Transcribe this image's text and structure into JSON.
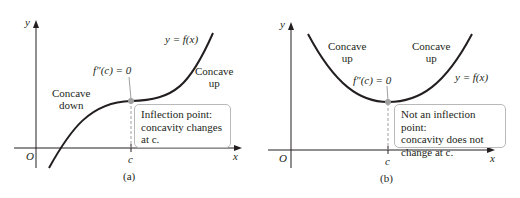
{
  "panels": [
    {
      "id": "a",
      "caption": "(a)",
      "axis": {
        "x_label": "x",
        "y_label": "y",
        "origin_label": "O",
        "tick_label": "c"
      },
      "curve_label": "y = f(x)",
      "point_label": "f″(c) = 0",
      "regions": [
        {
          "line1": "Concave",
          "line2": "down"
        },
        {
          "line1": "Concave",
          "line2": "up"
        }
      ],
      "note": {
        "line1": "Inflection point:",
        "line2": "concavity changes",
        "line3": "at c."
      }
    },
    {
      "id": "b",
      "caption": "(b)",
      "axis": {
        "x_label": "x",
        "y_label": "y",
        "origin_label": "O",
        "tick_label": "c"
      },
      "curve_label": "y = f(x)",
      "point_label": "f″(c) = 0",
      "regions": [
        {
          "line1": "Concave",
          "line2": "up"
        },
        {
          "line1": "Concave",
          "line2": "up"
        }
      ],
      "note": {
        "line1": "Not an inflection point:",
        "line2": "concavity does not",
        "line3": "change at c."
      }
    }
  ],
  "colors": {
    "curve": "#231f20",
    "axis": "#231f20",
    "point": "#a0a0a0",
    "dashed": "#a0a0a0",
    "note_border": "#b9b9b9"
  }
}
